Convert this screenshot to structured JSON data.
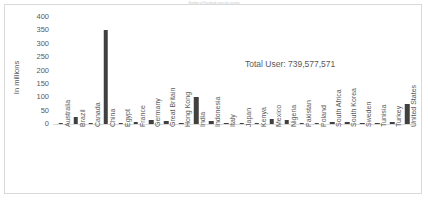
{
  "chart_data": {
    "type": "bar",
    "title": "Number of Facebook users by country",
    "xlabel": "",
    "ylabel": "In millions",
    "ylim": [
      0,
      400
    ],
    "yticks": [
      400,
      350,
      300,
      250,
      200,
      150,
      100,
      50,
      0
    ],
    "grid": false,
    "legend": "none",
    "bar_color": "#404040",
    "categories": [
      "Australia",
      "Brazil",
      "Canada",
      "China",
      "Egypt",
      "France",
      "Germany",
      "Great Britain",
      "Hong Kong",
      "India",
      "Indonesia",
      "Italy",
      "Japan",
      "Kenya",
      "Mexico",
      "Nigeria",
      "Pakistan",
      "Poland",
      "South Africa",
      "South Korea",
      "Sweden",
      "Tunisia",
      "Turkey",
      "United States"
    ],
    "values": [
      3,
      28,
      5,
      350,
      4,
      6,
      16,
      10,
      1,
      100,
      12,
      2,
      4,
      1,
      18,
      14,
      3,
      5,
      6,
      6,
      1,
      1,
      7,
      75
    ],
    "annotations": [
      {
        "text": "Total User: 739,577,571",
        "x": 240,
        "y": 54
      }
    ]
  },
  "annotation": {
    "total_label": "Total User: 739,577,571"
  },
  "axes": {
    "y_title": "In millions"
  }
}
